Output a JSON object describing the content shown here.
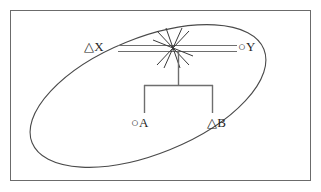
{
  "figure": {
    "kind": "node-link-diagram",
    "background_color": "#ffffff",
    "frame": {
      "name": "outer-border",
      "stroke_color": "#6b6b6b",
      "x": 10,
      "y": 10,
      "width": 301,
      "height": 171
    },
    "grouping_region": {
      "name": "ellipse-group",
      "shape": "ellipse",
      "stroke_color": "#4a4a4a",
      "center_x": 148,
      "center_y": 96,
      "radius_x": 125,
      "radius_y": 58,
      "rotation_deg": -22
    },
    "nodes": [
      {
        "id": "X",
        "label": "△X",
        "marker": "triangle",
        "marker_name": "triangle-marker",
        "x": 84,
        "y": 40
      },
      {
        "id": "Y",
        "label": "○Y",
        "marker": "circle",
        "marker_name": "circle-marker",
        "x": 238,
        "y": 40
      },
      {
        "id": "A",
        "label": "○A",
        "marker": "circle",
        "marker_name": "circle-marker",
        "x": 131,
        "y": 116
      },
      {
        "id": "B",
        "label": "△B",
        "marker": "triangle",
        "marker_name": "triangle-marker",
        "x": 207,
        "y": 116
      }
    ],
    "junction": {
      "name": "star-junction",
      "center_x": 173,
      "center_y": 48,
      "ray_count": 8,
      "ray_length": 20,
      "stroke_color": "#3a3a3a"
    },
    "edges": [
      {
        "name": "double-line-x-to-junction",
        "style": "double-horizontal",
        "from": "X",
        "to": "junction",
        "x1": 118,
        "x2": 173,
        "y_top": 45,
        "y_bottom": 51,
        "stroke_color": "#6e6e6e"
      },
      {
        "name": "double-line-junction-to-y",
        "style": "double-horizontal",
        "from": "junction",
        "to": "Y",
        "x1": 173,
        "x2": 237,
        "y_top": 45,
        "y_bottom": 51,
        "stroke_color": "#6e6e6e"
      },
      {
        "name": "bracket-stem",
        "style": "vertical",
        "from": "junction",
        "to": "bracket-bar",
        "x": 178,
        "y1": 51,
        "y2": 85,
        "stroke_color": "#6e6e6e"
      },
      {
        "name": "bracket-bar",
        "style": "horizontal",
        "x1": 144,
        "x2": 213,
        "y": 85,
        "stroke_color": "#6e6e6e"
      },
      {
        "name": "bracket-leg-a",
        "style": "vertical",
        "to": "A",
        "x": 144,
        "y1": 85,
        "y2": 113,
        "stroke_color": "#6e6e6e"
      },
      {
        "name": "bracket-leg-b",
        "style": "vertical",
        "to": "B",
        "x": 213,
        "y1": 85,
        "y2": 113,
        "stroke_color": "#6e6e6e"
      }
    ]
  },
  "labels": {
    "x": "△X",
    "y": "○Y",
    "a": "○A",
    "b": "△B"
  }
}
